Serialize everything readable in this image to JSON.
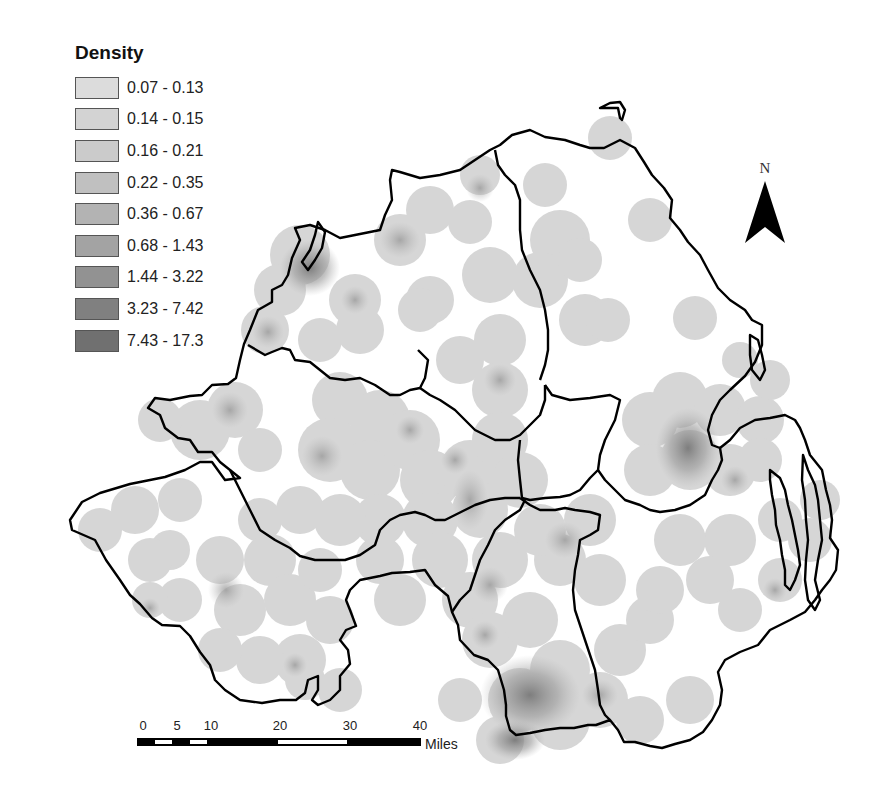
{
  "legend": {
    "title": "Density",
    "classes": [
      {
        "label": "0.07 - 0.13",
        "color": "#dcdcdc"
      },
      {
        "label": "0.14 - 0.15",
        "color": "#d3d3d3"
      },
      {
        "label": "0.16 - 0.21",
        "color": "#cbcbcb"
      },
      {
        "label": "0.22 - 0.35",
        "color": "#c0c0c0"
      },
      {
        "label": "0.36 - 0.67",
        "color": "#b3b3b3"
      },
      {
        "label": "0.68 - 1.43",
        "color": "#a3a3a3"
      },
      {
        "label": "1.44 - 3.22",
        "color": "#929292"
      },
      {
        "label": "3.23 - 7.42",
        "color": "#808080"
      },
      {
        "label": "7.43 - 17.3",
        "color": "#707070"
      }
    ]
  },
  "north_arrow": {
    "label": "N"
  },
  "scale_bar": {
    "ticks": [
      "0",
      "5",
      "10",
      "20",
      "30",
      "40"
    ],
    "unit": "Miles"
  },
  "map": {
    "region": "Northern Ireland",
    "boundary_color": "#000000",
    "background_color": "#ffffff",
    "hotspots": [
      {
        "name": "north-west",
        "cx": 310,
        "cy": 268,
        "level": 7
      },
      {
        "name": "east-central",
        "cx": 685,
        "cy": 450,
        "level": 8
      },
      {
        "name": "south",
        "cx": 530,
        "cy": 700,
        "level": 7
      },
      {
        "name": "central",
        "cx": 322,
        "cy": 456,
        "level": 5
      },
      {
        "name": "south-west",
        "cx": 226,
        "cy": 590,
        "level": 5
      }
    ]
  }
}
